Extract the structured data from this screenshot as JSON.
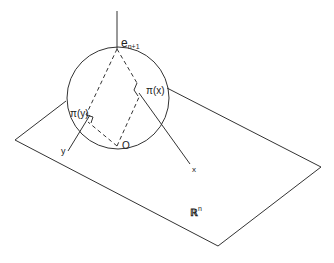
{
  "diagram": {
    "labels": {
      "north_pole": "e",
      "north_pole_sub": "n+1",
      "origin": "O",
      "pi_x": "π(x)",
      "pi_y": "π(y)",
      "x": "x",
      "y": "y",
      "space": "ℝ",
      "space_sup": "n"
    },
    "colors": {
      "stroke": "#333333",
      "background": "#ffffff"
    }
  }
}
